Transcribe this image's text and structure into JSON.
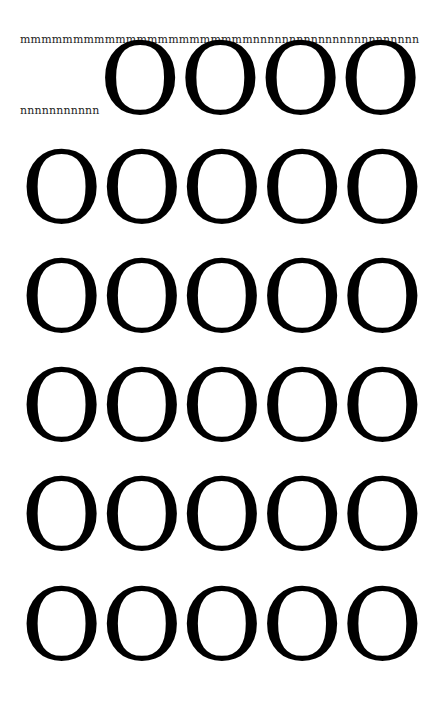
{
  "text_flow": {
    "line_1": "mmmmmmmmmmmmmmmmmmmmmmnnnnnnnnnnnnnnnnnnnnnnn",
    "line_2_small": "nnnnnnnnnnn",
    "line_2_large": "OOOO",
    "rows": [
      "OOOOO",
      "OOOOO",
      "OOOOO",
      "OOOOO",
      "OOOOO"
    ]
  },
  "colors": {
    "background": "#ffffff",
    "text": "#000000",
    "small_text": "#222222"
  }
}
